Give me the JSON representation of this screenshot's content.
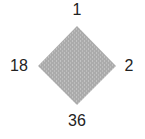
{
  "diagram": {
    "shape": "diamond",
    "fill_color": "#ababab",
    "texture_color": "#c4c4c4",
    "vertices": {
      "top": {
        "label": "1"
      },
      "right": {
        "label": "2"
      },
      "bottom": {
        "label": "36"
      },
      "left": {
        "label": "18"
      }
    }
  }
}
